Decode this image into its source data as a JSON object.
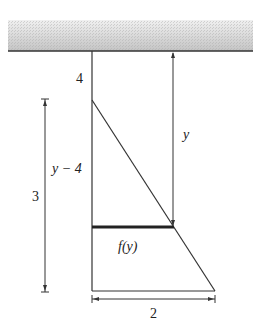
{
  "diagram": {
    "type": "tank-cross-section",
    "labels": {
      "top_offset": "4",
      "height": "3",
      "depth_minus": "y − 4",
      "depth": "y",
      "width_function": "f(y)",
      "base_width": "2"
    },
    "colors": {
      "line": "#333333",
      "ceiling_fill_light": "#e8e8e8",
      "ceiling_fill_dark": "#c8c8c8",
      "thick_line": "#222222"
    }
  }
}
